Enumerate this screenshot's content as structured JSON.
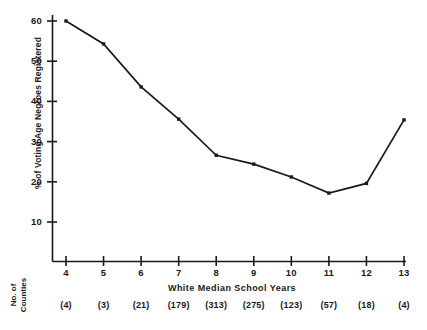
{
  "chart_data": {
    "type": "line",
    "title": "",
    "xlabel": "White Median School Years",
    "ylabel": "% of Voting Age Negroes Registered",
    "x": [
      4,
      5,
      6,
      7,
      8,
      9,
      10,
      11,
      12,
      13
    ],
    "values": [
      60,
      54.3,
      43.6,
      35.6,
      26.6,
      24.4,
      21.2,
      17.2,
      19.6,
      35.4
    ],
    "xtick_labels": [
      "4",
      "5",
      "6",
      "7",
      "8",
      "9",
      "10",
      "11",
      "12",
      "13"
    ],
    "ytick_labels": [
      "10",
      "20",
      "30",
      "40",
      "50",
      "60"
    ],
    "ytick_values": [
      10,
      20,
      30,
      40,
      50,
      60
    ],
    "xlim": [
      3.5,
      13.3
    ],
    "ylim": [
      5,
      62
    ],
    "grid": false,
    "legend": false,
    "markers": "filled-square",
    "line_color": "#1a1a1a",
    "secondary_axis": {
      "label_line1": "No. of",
      "label_line2": "Counties",
      "values": [
        "(4)",
        "(3)",
        "(21)",
        "(179)",
        "(313)",
        "(275)",
        "(123)",
        "(57)",
        "(18)",
        "(4)"
      ]
    }
  }
}
